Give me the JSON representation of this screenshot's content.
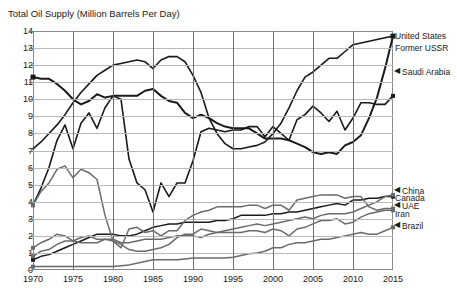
{
  "chart_data": {
    "type": "line",
    "title": "Total Oil Supply (Million Barrels Per Day)",
    "xlabel": "",
    "ylabel": "",
    "xlim": [
      1970,
      2015
    ],
    "ylim": [
      0,
      14
    ],
    "grid": true,
    "legend_position": "right-inline-labels",
    "xticks": [
      "1970",
      "1975",
      "1980",
      "1985",
      "1990",
      "1995",
      "2000",
      "2005",
      "2010",
      "2015"
    ],
    "yticks": [
      "0",
      "1",
      "2",
      "3",
      "4",
      "5",
      "6",
      "7",
      "8",
      "9",
      "10",
      "11",
      "12",
      "13",
      "14"
    ],
    "x": [
      1970,
      1971,
      1972,
      1973,
      1974,
      1975,
      1976,
      1977,
      1978,
      1979,
      1980,
      1981,
      1982,
      1983,
      1984,
      1985,
      1986,
      1987,
      1988,
      1989,
      1990,
      1991,
      1992,
      1993,
      1994,
      1995,
      1996,
      1997,
      1998,
      1999,
      2000,
      2001,
      2002,
      2003,
      2004,
      2005,
      2006,
      2007,
      2008,
      2009,
      2010,
      2011,
      2012,
      2013,
      2014,
      2015
    ],
    "series": [
      {
        "name": "United States",
        "color": "#1a1a1a",
        "width": 2.0,
        "marker": "square",
        "label_x": 2015,
        "label_y": 13.7,
        "values": [
          11.3,
          11.2,
          11.2,
          10.9,
          10.5,
          10.0,
          9.7,
          9.9,
          10.3,
          10.1,
          10.2,
          10.2,
          10.2,
          10.2,
          10.5,
          10.6,
          10.2,
          9.9,
          9.8,
          9.2,
          8.9,
          9.1,
          8.9,
          8.6,
          8.4,
          8.3,
          8.3,
          8.3,
          8.0,
          7.7,
          7.7,
          7.7,
          7.6,
          7.4,
          7.2,
          6.9,
          6.8,
          6.9,
          6.8,
          7.3,
          7.5,
          7.9,
          8.9,
          10.1,
          11.8,
          13.7
        ]
      },
      {
        "name": "Former USSR",
        "color": "#1a1a1a",
        "width": 1.6,
        "marker": "none",
        "label_x": 2015,
        "label_y": 13.0,
        "values": [
          7.1,
          7.5,
          8.0,
          8.5,
          9.1,
          9.8,
          10.4,
          10.9,
          11.4,
          11.7,
          12.0,
          12.1,
          12.2,
          12.3,
          12.2,
          11.8,
          12.3,
          12.5,
          12.5,
          12.2,
          11.4,
          10.4,
          8.9,
          8.0,
          7.4,
          7.1,
          7.1,
          7.2,
          7.3,
          7.5,
          8.0,
          8.6,
          9.5,
          10.5,
          11.3,
          11.6,
          12.0,
          12.4,
          12.4,
          12.8,
          13.2,
          13.3,
          13.4,
          13.5,
          13.6,
          13.7
        ]
      },
      {
        "name": "Saudi Arabia",
        "color": "#1a1a1a",
        "width": 1.6,
        "marker": "square",
        "label_x": 2015,
        "label_y": 11.6,
        "values": [
          3.8,
          4.8,
          6.0,
          7.6,
          8.5,
          7.1,
          8.6,
          9.2,
          8.3,
          9.5,
          10.2,
          10.0,
          6.5,
          5.1,
          4.7,
          3.4,
          5.1,
          4.3,
          5.1,
          5.1,
          6.4,
          8.1,
          8.3,
          8.2,
          8.1,
          8.2,
          8.2,
          8.4,
          8.4,
          7.8,
          8.4,
          8.0,
          7.6,
          8.8,
          9.1,
          9.6,
          9.2,
          8.7,
          9.3,
          8.2,
          8.9,
          9.8,
          9.8,
          9.7,
          9.7,
          10.2
        ]
      },
      {
        "name": "China",
        "color": "#1a1a1a",
        "width": 1.5,
        "marker": "square",
        "label_x": 2015,
        "label_y": 4.6,
        "values": [
          0.6,
          0.8,
          0.9,
          1.1,
          1.3,
          1.5,
          1.7,
          1.9,
          2.1,
          2.1,
          2.1,
          2.0,
          2.0,
          2.1,
          2.3,
          2.5,
          2.6,
          2.7,
          2.7,
          2.8,
          2.8,
          2.8,
          2.8,
          2.9,
          2.9,
          3.0,
          3.2,
          3.2,
          3.2,
          3.2,
          3.3,
          3.3,
          3.4,
          3.4,
          3.5,
          3.6,
          3.7,
          3.8,
          3.9,
          3.8,
          4.1,
          4.1,
          4.2,
          4.2,
          4.3,
          4.3
        ]
      },
      {
        "name": "Canada",
        "color": "#6b6b6b",
        "width": 1.5,
        "marker": "square",
        "label_x": 2015,
        "label_y": 4.2,
        "values": [
          1.3,
          1.6,
          1.8,
          2.1,
          2.0,
          1.7,
          1.6,
          1.6,
          1.6,
          1.8,
          1.8,
          1.6,
          1.6,
          1.7,
          1.8,
          1.8,
          1.8,
          1.9,
          2.0,
          2.0,
          2.0,
          1.9,
          2.1,
          2.2,
          2.3,
          2.4,
          2.5,
          2.6,
          2.7,
          2.6,
          2.7,
          2.8,
          2.9,
          3.0,
          3.1,
          3.0,
          3.2,
          3.3,
          3.3,
          3.3,
          3.4,
          3.6,
          3.8,
          4.0,
          4.3,
          4.4
        ]
      },
      {
        "name": "UAE",
        "color": "#6b6b6b",
        "width": 1.5,
        "marker": "square",
        "label_x": 2015,
        "label_y": 3.75,
        "values": [
          0.8,
          1.1,
          1.2,
          1.5,
          1.7,
          1.7,
          1.9,
          2.0,
          1.8,
          1.8,
          1.7,
          1.5,
          1.2,
          1.1,
          1.1,
          1.2,
          1.3,
          1.5,
          1.9,
          2.1,
          2.1,
          2.4,
          2.3,
          2.2,
          2.2,
          2.2,
          2.2,
          2.3,
          2.3,
          2.2,
          2.4,
          2.3,
          2.0,
          2.4,
          2.5,
          2.7,
          2.9,
          2.9,
          3.0,
          2.7,
          2.8,
          3.1,
          3.3,
          3.4,
          3.5,
          3.5
        ]
      },
      {
        "name": "Iran",
        "color": "#6b6b6b",
        "width": 1.5,
        "marker": "square",
        "label_x": 2015,
        "label_y": 3.3,
        "values": [
          3.8,
          4.6,
          5.1,
          5.9,
          6.1,
          5.4,
          5.9,
          5.7,
          5.3,
          3.2,
          1.7,
          1.3,
          2.4,
          2.5,
          2.2,
          2.3,
          2.0,
          2.3,
          2.3,
          2.9,
          3.2,
          3.4,
          3.5,
          3.7,
          3.7,
          3.7,
          3.7,
          3.8,
          3.8,
          3.6,
          3.8,
          3.8,
          3.5,
          4.1,
          4.2,
          4.3,
          4.4,
          4.4,
          4.4,
          4.2,
          4.3,
          4.3,
          3.7,
          3.5,
          3.6,
          3.6
        ]
      },
      {
        "name": "Brazil",
        "color": "#6b6b6b",
        "width": 1.5,
        "marker": "square",
        "label_x": 2015,
        "label_y": 2.55,
        "values": [
          0.2,
          0.2,
          0.2,
          0.2,
          0.2,
          0.2,
          0.2,
          0.2,
          0.2,
          0.2,
          0.2,
          0.25,
          0.3,
          0.4,
          0.5,
          0.6,
          0.6,
          0.6,
          0.6,
          0.65,
          0.7,
          0.7,
          0.7,
          0.7,
          0.7,
          0.75,
          0.85,
          0.95,
          1.0,
          1.1,
          1.3,
          1.3,
          1.5,
          1.6,
          1.6,
          1.7,
          1.8,
          1.8,
          1.9,
          2.0,
          2.1,
          2.2,
          2.1,
          2.1,
          2.3,
          2.5
        ]
      }
    ],
    "annotations": [
      {
        "text": "United States",
        "x": 2015,
        "y": 13.7,
        "arrow": false
      },
      {
        "text": "Former USSR",
        "x": 2015,
        "y": 13.0,
        "arrow": false
      },
      {
        "text": "Saudi Arabia",
        "x": 2015,
        "y": 11.6,
        "arrow": true
      },
      {
        "text": "China",
        "x": 2015,
        "y": 4.6,
        "arrow": true
      },
      {
        "text": "Canada",
        "x": 2015,
        "y": 4.2,
        "arrow": false
      },
      {
        "text": "UAE",
        "x": 2015,
        "y": 3.75,
        "arrow": true
      },
      {
        "text": "Iran",
        "x": 2015,
        "y": 3.3,
        "arrow": false
      },
      {
        "text": "Brazil",
        "x": 2015,
        "y": 2.55,
        "arrow": true
      }
    ]
  }
}
